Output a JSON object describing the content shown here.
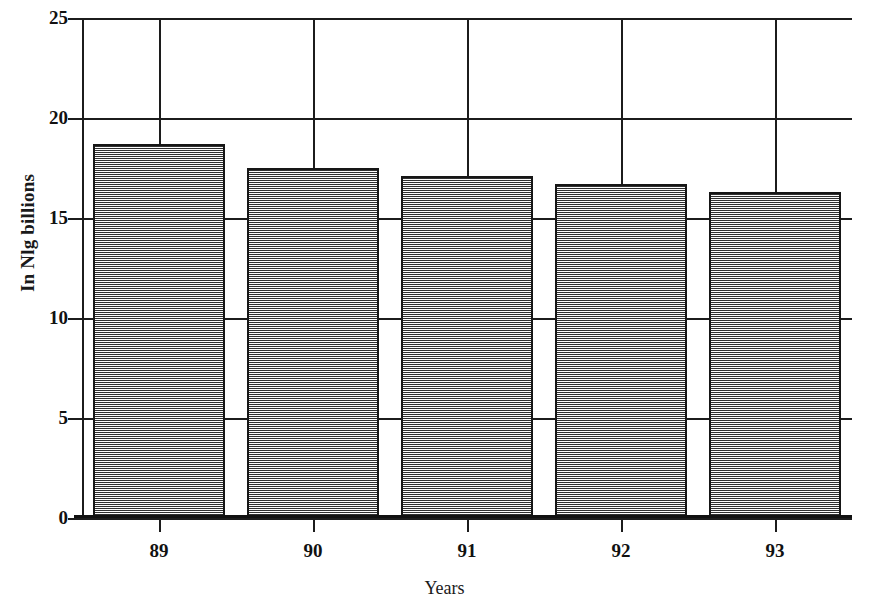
{
  "chart_data": {
    "type": "bar",
    "title": "",
    "subtitle": "",
    "xlabel": "Years",
    "ylabel": "In Nlg billions",
    "categories": [
      "89",
      "90",
      "91",
      "92",
      "93"
    ],
    "values": [
      18.7,
      17.5,
      17.1,
      16.7,
      16.3
    ],
    "series": [
      {
        "name": "In Nlg billions",
        "values": [
          18.7,
          17.5,
          17.1,
          16.7,
          16.3
        ]
      }
    ],
    "ylim": [
      0,
      25
    ],
    "yticks": [
      0,
      5,
      10,
      15,
      20,
      25
    ],
    "ytick_labels": [
      "0",
      "5",
      "10",
      "15",
      "20",
      "25"
    ],
    "xtick_labels": [
      "89",
      "90",
      "91",
      "92",
      "93"
    ],
    "grid": true,
    "grid_axis": "both",
    "legend": false,
    "legend_position": "none",
    "bar_fill": "#a9a9a9",
    "bar_pattern": "checkerboard-dither",
    "bar_border": "#161616",
    "axis_color": "#1c1c1c",
    "background": "#ffffff"
  },
  "axes": {
    "y": {
      "label": "In Nlg billions",
      "ticks": [
        {
          "label": "25",
          "value": 25
        },
        {
          "label": "20",
          "value": 20
        },
        {
          "label": "15",
          "value": 15
        },
        {
          "label": "10",
          "value": 10
        },
        {
          "label": "5",
          "value": 5
        },
        {
          "label": "0",
          "value": 0
        }
      ]
    },
    "x": {
      "label": "Years",
      "ticks": [
        {
          "label": "89"
        },
        {
          "label": "90"
        },
        {
          "label": "91"
        },
        {
          "label": "92"
        },
        {
          "label": "93"
        }
      ]
    }
  }
}
